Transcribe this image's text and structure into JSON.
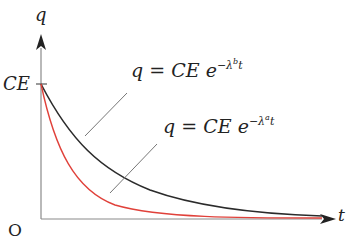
{
  "diagram": {
    "axes": {
      "y_label": "q",
      "x_label": "t",
      "origin_label": "O",
      "y_tick_label": "CE"
    },
    "curves": [
      {
        "id": "slow",
        "color": "#2b2b2b",
        "equation": {
          "lhs": "q",
          "equals": "=",
          "rhs_base": "CE",
          "exp_base": "e",
          "exp_sign": "−λ",
          "exp_sub": "b",
          "exp_var": "t"
        }
      },
      {
        "id": "fast",
        "color": "#e0413a",
        "equation": {
          "lhs": "q",
          "equals": "=",
          "rhs_base": "CE",
          "exp_base": "e",
          "exp_sign": "−λ",
          "exp_sub": "a",
          "exp_var": "t"
        }
      }
    ],
    "colors": {
      "axis": "#8a8a8a",
      "arrow": "#222222",
      "leader": "#777777"
    }
  }
}
